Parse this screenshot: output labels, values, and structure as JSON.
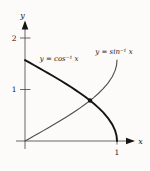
{
  "figure": {
    "background": "#fcfbf9",
    "axis_color": "#555555",
    "text_color": "#1a1a1a"
  },
  "chart_data": {
    "type": "line",
    "title": "",
    "xlabel": "x",
    "ylabel": "y",
    "xlim": [
      0,
      1.2
    ],
    "ylim": [
      0,
      2.3
    ],
    "grid": false,
    "legend": "inline-curve-labels",
    "x_ticks": [
      {
        "value": 1,
        "label": "1"
      }
    ],
    "y_ticks": [
      {
        "value": 1,
        "label": "1"
      },
      {
        "value": 2,
        "label": "2"
      }
    ],
    "x": [
      0,
      0.05,
      0.1,
      0.15,
      0.2,
      0.25,
      0.3,
      0.35,
      0.4,
      0.45,
      0.5,
      0.55,
      0.6,
      0.65,
      0.7,
      0.75,
      0.8,
      0.85,
      0.9,
      0.95,
      0.98,
      0.995,
      1
    ],
    "series": [
      {
        "name": "y = cos⁻¹ x",
        "values": [
          1.5708,
          1.5208,
          1.4706,
          1.4202,
          1.3694,
          1.3181,
          1.2661,
          1.2132,
          1.1593,
          1.104,
          1.0472,
          0.9884,
          0.9273,
          0.8632,
          0.7954,
          0.7227,
          0.6435,
          0.5548,
          0.451,
          0.3176,
          0.1997,
          0.1,
          0
        ],
        "color": "#141414",
        "width": 1.9,
        "label_x": 0.37,
        "label_y": 1.6
      },
      {
        "name": "y = sin⁻¹ x",
        "values": [
          0,
          0.05,
          0.1002,
          0.1506,
          0.2014,
          0.2527,
          0.3047,
          0.3576,
          0.4115,
          0.4668,
          0.5236,
          0.5824,
          0.6435,
          0.7076,
          0.7754,
          0.8481,
          0.9273,
          1.016,
          1.1198,
          1.2532,
          1.3711,
          1.4708,
          1.5708
        ],
        "color": "#4d4d4d",
        "width": 1.1,
        "label_x": 0.967,
        "label_y": 1.73
      }
    ],
    "annotations": [
      {
        "type": "point",
        "x": 0.7071,
        "y": 0.7854,
        "note": "intersection of arccos and arcsin"
      }
    ]
  }
}
